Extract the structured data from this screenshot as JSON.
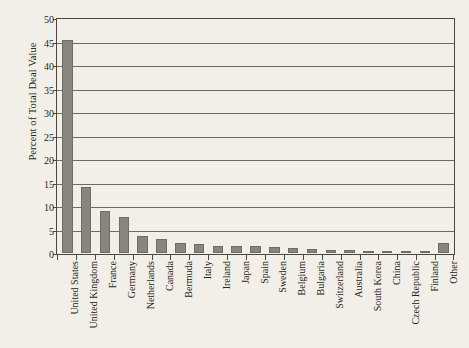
{
  "chart_data": {
    "type": "bar",
    "title": "",
    "subtitle": "",
    "xlabel": "",
    "ylabel": "Percent of Total Deal Value",
    "ylim": [
      0,
      50
    ],
    "ytick_values": [
      0,
      5,
      10,
      15,
      20,
      25,
      30,
      35,
      40,
      45,
      50
    ],
    "ytick_labels": [
      "0",
      "5",
      "10",
      "15",
      "20",
      "25",
      "30",
      "35",
      "40",
      "45",
      "50"
    ],
    "grid": "horizontal",
    "legend": "none",
    "bar_color": "#878580",
    "background_color": "#f2efe9",
    "axis_color": "#4a4742",
    "categories": [
      "United States",
      "United Kingdom",
      "France",
      "Germany",
      "Netherlands",
      "Canada",
      "Bermuda",
      "Italy",
      "Ireland",
      "Japan",
      "Spain",
      "Sweden",
      "Belgium",
      "Bulgaria",
      "Switzerland",
      "Australia",
      "South Korea",
      "China",
      "Czech Republic",
      "Finland",
      "Other"
    ],
    "values": [
      45.7,
      14.2,
      9.0,
      7.7,
      3.7,
      3.0,
      2.1,
      2.0,
      1.6,
      1.5,
      1.4,
      1.2,
      1.1,
      0.9,
      0.7,
      0.6,
      0.5,
      0.4,
      0.35,
      0.3,
      2.2
    ],
    "value_unit": "percent"
  }
}
